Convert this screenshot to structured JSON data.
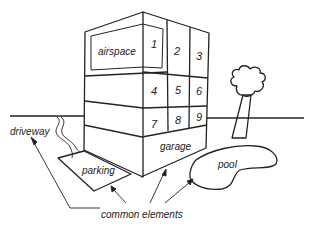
{
  "diagram": {
    "labels": {
      "airspace": "airspace",
      "garage": "garage",
      "parking": "parking",
      "pool": "pool",
      "driveway": "driveway",
      "common_elements": "common elements"
    },
    "units": [
      "1",
      "2",
      "3",
      "4",
      "5",
      "6",
      "7",
      "8",
      "9"
    ],
    "colors": {
      "stroke": "#222222",
      "background": "#ffffff"
    }
  }
}
